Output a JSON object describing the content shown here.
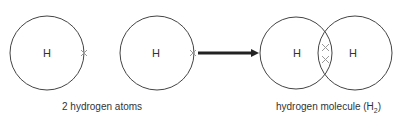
{
  "diagram": {
    "atoms": [
      {
        "symbol": "H",
        "cx": 47,
        "cy": 53,
        "r": 37
      },
      {
        "symbol": "H",
        "cx": 157,
        "cy": 53,
        "r": 37
      }
    ],
    "molecule": {
      "atoms": [
        {
          "symbol": "H",
          "cx": 296,
          "cy": 53,
          "r": 36
        },
        {
          "symbol": "H",
          "cx": 355,
          "cy": 53,
          "r": 37
        }
      ]
    },
    "electron_marker": "×",
    "captions": {
      "left": "2 hydrogen atoms",
      "right_prefix": "hydrogen molecule (H",
      "right_sub": "2",
      "right_suffix": ")"
    },
    "colors": {
      "circle": "#444444",
      "electron": "#999999",
      "arrow": "#222222",
      "text": "#333333"
    }
  }
}
